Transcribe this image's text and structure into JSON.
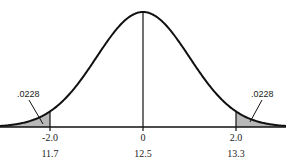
{
  "chart_data": {
    "type": "area",
    "title": "",
    "mean": 0,
    "sd": 1,
    "x_range": [
      -3.4,
      3.4
    ],
    "tails": [
      {
        "side": "left",
        "from": -3.4,
        "to": -2.0,
        "area_label": ".0228"
      },
      {
        "side": "right",
        "from": 2.0,
        "to": 3.4,
        "area_label": ".0228"
      }
    ],
    "z_ticks": [
      {
        "z": -2.0,
        "label": "-2.0",
        "raw": "11.7"
      },
      {
        "z": 0,
        "label": "0",
        "raw": "12.5"
      },
      {
        "z": 2.0,
        "label": "2.0",
        "raw": "13.3"
      }
    ],
    "colors": {
      "curve": "#111111",
      "shade": "#b8b8b8"
    }
  }
}
